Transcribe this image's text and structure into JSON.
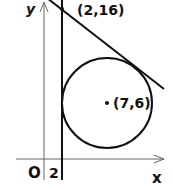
{
  "diagram": {
    "axes": {
      "x_label": "x",
      "y_label": "y",
      "origin_label": "O"
    },
    "vertical_line": {
      "label": "2",
      "equation": "x = 2"
    },
    "tangent_point": {
      "label": "(2,16)"
    },
    "circle": {
      "center_label": "(7,6)"
    },
    "colors": {
      "stroke": "#111111",
      "axis": "#555555",
      "background": "#ffffff"
    }
  }
}
